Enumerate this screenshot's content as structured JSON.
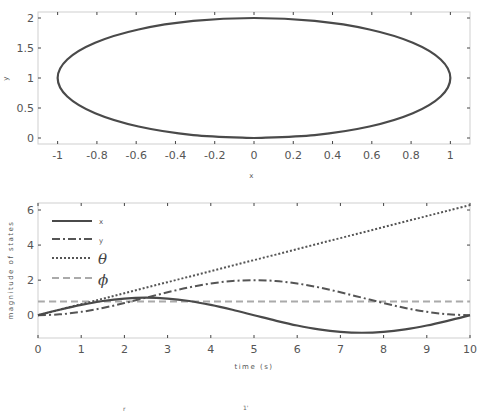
{
  "chart_data": [
    {
      "type": "line",
      "title": "",
      "xlabel": "x",
      "ylabel": "y",
      "xlim": [
        -1.1,
        1.1
      ],
      "ylim": [
        -0.1,
        2.1
      ],
      "xticks": [
        -1,
        -0.8,
        -0.6,
        -0.4,
        -0.2,
        0,
        0.2,
        0.4,
        0.6,
        0.8,
        1
      ],
      "xtick_labels": [
        "-1",
        "-0.8",
        "-0.6",
        "-0.4",
        "-0.2",
        "0",
        "0.2",
        "0.4",
        "0.6",
        "0.8",
        "1"
      ],
      "yticks": [
        0,
        0.5,
        1,
        1.5,
        2
      ],
      "ytick_labels": [
        "0",
        "0.5",
        "1",
        "1.5",
        "2"
      ],
      "grid": false,
      "series": [
        {
          "name": "trajectory",
          "style": "solid",
          "color": "#4a4a4a",
          "description": "closed ellipse x = sin(2πt/10), y = 1 - cos(2πt/10)",
          "x": [
            0,
            0.309,
            0.588,
            0.809,
            0.951,
            1,
            0.951,
            0.809,
            0.588,
            0.309,
            0,
            -0.309,
            -0.588,
            -0.809,
            -0.951,
            -1,
            -0.951,
            -0.809,
            -0.588,
            -0.309,
            0
          ],
          "y": [
            0,
            0.049,
            0.191,
            0.412,
            0.691,
            1,
            1.309,
            1.588,
            1.809,
            1.951,
            2,
            1.951,
            1.809,
            1.588,
            1.309,
            1,
            0.691,
            0.412,
            0.191,
            0.049,
            0
          ]
        }
      ]
    },
    {
      "type": "line",
      "title": "",
      "xlabel": "time (s)",
      "ylabel": "magnitude of states",
      "xlim": [
        0,
        10
      ],
      "ylim": [
        -1.3,
        6.4
      ],
      "xticks": [
        0,
        1,
        2,
        3,
        4,
        5,
        6,
        7,
        8,
        9,
        10
      ],
      "xtick_labels": [
        "0",
        "1",
        "2",
        "3",
        "4",
        "5",
        "6",
        "7",
        "8",
        "9",
        "10"
      ],
      "yticks": [
        0,
        2,
        4,
        6
      ],
      "ytick_labels": [
        "0",
        "2",
        "4",
        "6"
      ],
      "grid": false,
      "legend_position": "upper left",
      "x": [
        0,
        0.5,
        1,
        1.5,
        2,
        2.5,
        3,
        3.5,
        4,
        4.5,
        5,
        5.5,
        6,
        6.5,
        7,
        7.5,
        8,
        8.5,
        9,
        9.5,
        10
      ],
      "series": [
        {
          "name": "x",
          "legend_label": "x",
          "style": "solid",
          "color": "#4a4a4a",
          "values": [
            0,
            0.309,
            0.588,
            0.809,
            0.951,
            1,
            0.951,
            0.809,
            0.588,
            0.309,
            0,
            -0.309,
            -0.588,
            -0.809,
            -0.951,
            -1,
            -0.951,
            -0.809,
            -0.588,
            -0.309,
            0
          ]
        },
        {
          "name": "y",
          "legend_label": "y",
          "style": "dashdot",
          "color": "#555555",
          "values": [
            0,
            0.049,
            0.191,
            0.412,
            0.691,
            1,
            1.309,
            1.588,
            1.809,
            1.951,
            2,
            1.951,
            1.809,
            1.588,
            1.309,
            1,
            0.691,
            0.412,
            0.191,
            0.049,
            0
          ]
        },
        {
          "name": "theta",
          "legend_label": "θ",
          "style": "dotted",
          "color": "#555555",
          "values": [
            0,
            0.314,
            0.628,
            0.942,
            1.257,
            1.571,
            1.885,
            2.199,
            2.513,
            2.827,
            3.142,
            3.456,
            3.77,
            4.084,
            4.398,
            4.712,
            5.027,
            5.341,
            5.655,
            5.969,
            6.283
          ]
        },
        {
          "name": "phi",
          "legend_label": "ϕ",
          "style": "dashed",
          "color": "#aaaaaa",
          "values": [
            0.785,
            0.785,
            0.785,
            0.785,
            0.785,
            0.785,
            0.785,
            0.785,
            0.785,
            0.785,
            0.785,
            0.785,
            0.785,
            0.785,
            0.785,
            0.785,
            0.785,
            0.785,
            0.785,
            0.785,
            0.785
          ]
        }
      ]
    }
  ],
  "top_plot": {
    "xlabel": "x",
    "ylabel": "y"
  },
  "bottom_plot": {
    "xlabel": "time (s)",
    "ylabel": "magnitude of states",
    "legend": [
      "x",
      "y",
      "θ",
      "ϕ"
    ]
  },
  "footer": {
    "left_fragment": "r",
    "right_fragment": "1'"
  }
}
